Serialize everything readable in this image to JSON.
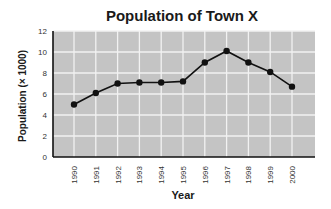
{
  "chart_data": {
    "type": "line",
    "title": "Population of Town X",
    "xlabel": "Year",
    "ylabel": "Population (× 1000)",
    "categories": [
      "1990",
      "1991",
      "1992",
      "1993",
      "1994",
      "1995",
      "1996",
      "1997",
      "1998",
      "1999",
      "2000"
    ],
    "values": [
      5.0,
      6.1,
      7.0,
      7.1,
      7.1,
      7.2,
      9.0,
      10.1,
      9.0,
      8.1,
      6.7
    ],
    "ylim": [
      0,
      12
    ],
    "yticks": [
      0,
      2,
      4,
      6,
      8,
      10,
      12
    ],
    "grid": true,
    "legend": null
  },
  "colors": {
    "plot_background": "#c4c4c4",
    "gridline": "#f2f2f2",
    "line": "#111111",
    "marker": "#111111",
    "axis": "#111111"
  }
}
